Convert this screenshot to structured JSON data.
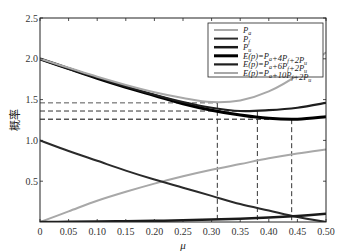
{
  "chart_data": {
    "type": "line",
    "title": "",
    "xlabel": "μ",
    "ylabel": "概率",
    "xlim": [
      0,
      0.5
    ],
    "ylim": [
      0,
      2.5
    ],
    "grid": false,
    "legend_position": "upper right",
    "x_ticks": [
      "0",
      "0.05",
      "0.10",
      "0.15",
      "0.20",
      "0.25",
      "0.30",
      "0.35",
      "0.40",
      "0.45",
      "0.50"
    ],
    "y_ticks": [
      "0.5",
      "1.0",
      "1.5",
      "2.0",
      "2.5"
    ],
    "x": [
      0,
      0.05,
      0.1,
      0.15,
      0.2,
      0.25,
      0.3,
      0.35,
      0.4,
      0.45,
      0.5
    ],
    "series": [
      {
        "name": "Pa",
        "label_main": "P",
        "label_sub": "a",
        "color": "#a8a8a8",
        "width": 2,
        "values": [
          0,
          0.13,
          0.26,
          0.37,
          0.47,
          0.56,
          0.64,
          0.71,
          0.78,
          0.84,
          0.89
        ]
      },
      {
        "name": "Pf",
        "label_main": "P",
        "label_sub": "f",
        "color": "#2a2a2a",
        "width": 2,
        "values": [
          1.0,
          0.87,
          0.75,
          0.63,
          0.52,
          0.42,
          0.32,
          0.22,
          0.14,
          0.06,
          0.0
        ]
      },
      {
        "name": "Pu",
        "label_main": "P",
        "label_sub": "u",
        "color": "#1a1a1a",
        "width": 2.5,
        "values": [
          0,
          0.002,
          0.005,
          0.01,
          0.015,
          0.02,
          0.03,
          0.04,
          0.055,
          0.075,
          0.1
        ]
      },
      {
        "name": "E(p)=Pa+4Pf+2Pu",
        "label": "E(p)=Pₐ+4Pᶠ+2Pᵤ",
        "color": "#000000",
        "width": 3,
        "values": [
          2.0,
          1.88,
          1.76,
          1.65,
          1.55,
          1.45,
          1.37,
          1.31,
          1.27,
          1.26,
          1.29
        ]
      },
      {
        "name": "E(p)=Pa+6Pf+2Pu",
        "label": "E(p)=Pₐ+6Pᶠ+2Pᵤ",
        "color": "#1e1e1e",
        "width": 2.2,
        "values": [
          2.0,
          1.88,
          1.77,
          1.66,
          1.56,
          1.47,
          1.4,
          1.36,
          1.37,
          1.4,
          1.46
        ]
      },
      {
        "name": "E(p)=Pa+10Pf+2Pu",
        "label": "E(p)=Pₐ+10Pᶠ+2Pᵤ",
        "color": "#a8a8a8",
        "width": 2,
        "values": [
          2.0,
          1.89,
          1.78,
          1.68,
          1.59,
          1.52,
          1.47,
          1.49,
          1.6,
          1.8,
          2.08
        ]
      }
    ],
    "legend_labels": [
      {
        "main": "P",
        "sub": "a"
      },
      {
        "main": "P",
        "sub": "f"
      },
      {
        "main": "P",
        "sub": "u"
      },
      {
        "text": "E(p)=P",
        "sub1": "a",
        "mid1": "+4P",
        "sub2": "f",
        "mid2": "+2P",
        "sub3": "u"
      },
      {
        "text": "E(p)=P",
        "sub1": "a",
        "mid1": "+6P",
        "sub2": "f",
        "mid2": "+2P",
        "sub3": "u"
      },
      {
        "text": "E(p)=P",
        "sub1": "a",
        "mid1": "+10P",
        "sub2": "f",
        "mid2": "+2P",
        "sub3": "u"
      }
    ],
    "annotations": [
      {
        "type": "hline",
        "y": 1.46,
        "x_end": 0.31,
        "color": "#555555",
        "style": "dashed"
      },
      {
        "type": "hline",
        "y": 1.36,
        "x_end": 0.38,
        "color": "#333333",
        "style": "dashed"
      },
      {
        "type": "hline",
        "y": 1.26,
        "x_end": 0.44,
        "color": "#000000",
        "style": "dashed"
      },
      {
        "type": "vline",
        "x": 0.31,
        "y_end": 1.46,
        "color": "#333333",
        "style": "dashed"
      },
      {
        "type": "vline",
        "x": 0.38,
        "y_end": 1.36,
        "color": "#333333",
        "style": "dashed"
      },
      {
        "type": "vline",
        "x": 0.44,
        "y_end": 1.26,
        "color": "#333333",
        "style": "dashed"
      }
    ]
  }
}
